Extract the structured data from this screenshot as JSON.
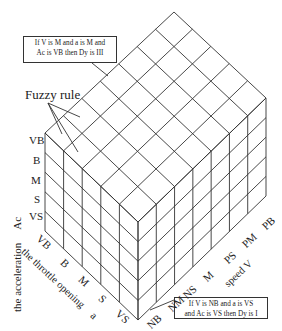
{
  "diagram": {
    "fuzzy_rule_label": "Fuzzy rule",
    "rule_top": {
      "line1": "If V is M and a is M  and",
      "line2": "Ac is VB then Dy is III"
    },
    "rule_bottom": {
      "line1": "If V is NB and a is VS",
      "line2": "and Ac is VS then Dy is I"
    },
    "acceleration_axis": {
      "title": "the acceleration  Ac",
      "title_main": "the acceleration",
      "symbol": "Ac",
      "levels": [
        "VB",
        "B",
        "M",
        "S",
        "VS"
      ]
    },
    "throttle_axis": {
      "title_main": "the throttle opening",
      "symbol": "a",
      "levels": [
        "VB",
        "B",
        "M",
        "S",
        "VS"
      ]
    },
    "speed_axis": {
      "title_main": "speed",
      "symbol": "V",
      "levels": [
        "NB",
        "NM",
        "NS",
        "M",
        "PS",
        "PM",
        "PB"
      ]
    },
    "grid": {
      "acceleration_divisions": 5,
      "throttle_divisions": 5,
      "speed_divisions": 7
    },
    "line_color": "#333333"
  }
}
